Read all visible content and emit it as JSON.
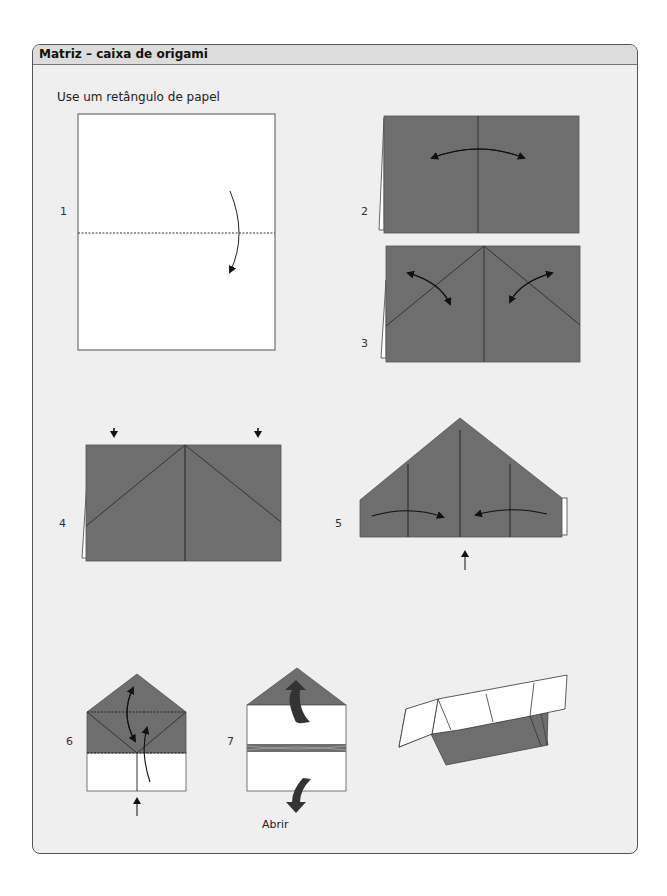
{
  "panel": {
    "title": "Matriz – caixa de origami",
    "subtitle": "Use um retângulo de papel"
  },
  "steps": [
    {
      "number": "1",
      "description": "White rectangle, dashed horizontal fold line, curved arrow folding top down"
    },
    {
      "number": "2",
      "description": "Gray folded rectangle, vertical center crease, double-headed arc arrow"
    },
    {
      "number": "3",
      "description": "Gray rectangle with diagonal creases from top center, two curved double arrows"
    },
    {
      "number": "4",
      "description": "Gray rectangle with diagonal fold lines, two down arrows above"
    },
    {
      "number": "5",
      "description": "Pentagon house shape with arrows folding sides to center, up arrow below"
    },
    {
      "number": "6",
      "description": "Narrow house shape, dashed fold lines, curved arrows, up arrow below"
    },
    {
      "number": "7",
      "description": "House shape with thick arrows up and down indicating open"
    }
  ],
  "labels": {
    "open": "Abrir"
  },
  "colors": {
    "paper_gray": "#6e6e6e",
    "paper_white": "#ffffff",
    "panel_bg": "#efefef",
    "header_bg": "#dcdcdc",
    "line": "#333333"
  }
}
